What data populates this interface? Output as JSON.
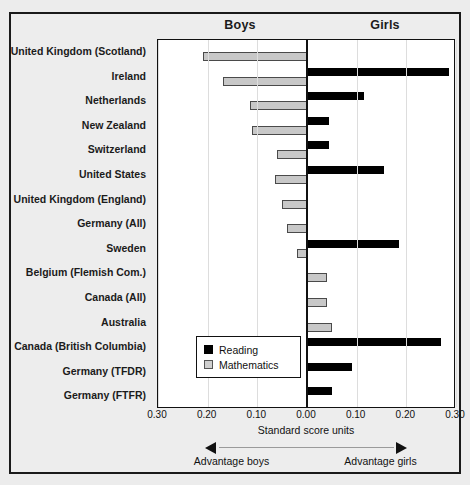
{
  "header": {
    "boys_label": "Boys",
    "girls_label": "Girls",
    "top_fragment": ""
  },
  "legend": {
    "position": "inside-lower-left",
    "items": [
      {
        "label": "Reading",
        "color": "#000000",
        "swatch": "black"
      },
      {
        "label": "Mathematics",
        "color": "#c8c8c8",
        "swatch": "gray"
      }
    ]
  },
  "axis": {
    "title": "Standard score units",
    "ticks": [
      "0.30",
      "0.20",
      "0.10",
      "0.00",
      "0.10",
      "0.20",
      "0.30"
    ],
    "tick_values": [
      -0.3,
      -0.2,
      -0.1,
      0.0,
      0.1,
      0.2,
      0.3
    ],
    "advantage_boys": "Advantage boys",
    "advantage_girls": "Advantage girls"
  },
  "chart_data": {
    "type": "bar",
    "orientation": "horizontal-diverging",
    "title": "",
    "xlabel": "Standard score units",
    "ylabel": "",
    "xlim": [
      -0.3,
      0.3
    ],
    "grid": true,
    "legend_position": "inside-lower-left",
    "note": "Negative values indicate advantage boys; positive values indicate advantage girls.",
    "categories": [
      "United Kingdom (Scotland)",
      "Ireland",
      "Netherlands",
      "New Zealand",
      "Switzerland",
      "United States",
      "United Kingdom (England)",
      "Germany (All)",
      "Sweden",
      "Belgium (Flemish Com.)",
      "Canada (All)",
      "Australia",
      "Canada (British Columbia)",
      "Germany (TFDR)",
      "Germany (FTFR)"
    ],
    "series": [
      {
        "name": "Reading",
        "color": "#000000",
        "values": [
          0.0,
          0.285,
          0.115,
          0.045,
          0.045,
          0.155,
          0.0,
          0.0,
          0.185,
          0.0,
          0.0,
          0.0,
          0.27,
          0.09,
          0.05
        ]
      },
      {
        "name": "Mathematics",
        "color": "#c8c8c8",
        "values": [
          -0.21,
          -0.17,
          -0.115,
          -0.11,
          -0.06,
          -0.065,
          -0.05,
          -0.04,
          -0.02,
          0.04,
          0.04,
          0.05,
          0.0,
          0.0,
          0.0
        ]
      }
    ]
  }
}
